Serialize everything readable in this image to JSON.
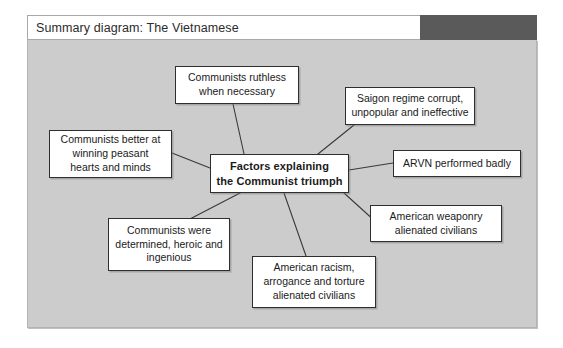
{
  "window": {
    "title": "Summary diagram: The Vietnamese",
    "tab_color": "#5a5a5a",
    "canvas_color": "#cccccc"
  },
  "diagram": {
    "type": "mind-map",
    "center": {
      "id": "center",
      "label": "Factors explaining the Communist triumph",
      "line1": "Factors explaining",
      "line2": "the Communist triumph"
    },
    "nodes": [
      {
        "id": "ruthless",
        "label": "Communists ruthless when necessary",
        "lines": [
          "Communists ruthless",
          "when necessary"
        ]
      },
      {
        "id": "saigon",
        "label": "Saigon regime corrupt, unpopular and ineffective",
        "lines": [
          "Saigon regime corrupt,",
          "unpopular and ineffective"
        ]
      },
      {
        "id": "peasant",
        "label": "Communists better at winning peasant hearts and minds",
        "lines": [
          "Communists better at",
          "winning peasant",
          "hearts and minds"
        ]
      },
      {
        "id": "arvn",
        "label": "ARVN performed badly",
        "lines": [
          "ARVN performed badly"
        ]
      },
      {
        "id": "weaponry",
        "label": "American weaponry alienated civilians",
        "lines": [
          "American weaponry",
          "alienated civilians"
        ]
      },
      {
        "id": "determined",
        "label": "Communists were determined, heroic and ingenious",
        "lines": [
          "Communists were",
          "determined, heroic and",
          "ingenious"
        ]
      },
      {
        "id": "racism",
        "label": "American racism, arrogance and torture alienated civilians",
        "lines": [
          "American racism,",
          "arrogance and torture",
          "alienated civilians"
        ]
      }
    ],
    "connector_color": "#3a3a3a"
  }
}
